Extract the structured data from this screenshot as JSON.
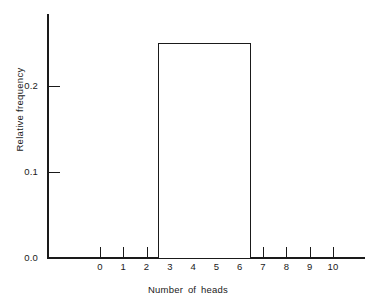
{
  "chart_data": {
    "type": "bar",
    "title": "",
    "subtitle": "",
    "xlabel": "Number of heads",
    "ylabel": "Relative frequency",
    "xlim": [
      -0.5,
      11.5
    ],
    "ylim": [
      0.0,
      0.28
    ],
    "grid": false,
    "legend": null,
    "x_tick_labels": [
      "0",
      "1",
      "2",
      "3",
      "4",
      "5",
      "6",
      "7",
      "8",
      "9",
      "10"
    ],
    "x_tick_values": [
      0,
      1,
      2,
      3,
      4,
      5,
      6,
      7,
      8,
      9,
      10
    ],
    "y_tick_labels": [
      "0.0",
      "0.1",
      "0.2"
    ],
    "y_tick_values": [
      0.0,
      0.1,
      0.2
    ],
    "categories": [
      "0",
      "1",
      "2",
      "3",
      "4",
      "5",
      "6",
      "7",
      "8",
      "9",
      "10"
    ],
    "values": [
      0,
      0,
      0,
      0.25,
      0.25,
      0.25,
      0.25,
      0,
      0,
      0,
      0
    ],
    "bars": [
      {
        "label": "3-6",
        "x_start": 2.5,
        "x_end": 6.5,
        "height": 0.25
      }
    ],
    "annotations": [],
    "colors": {
      "axis": "#1a1a1a",
      "bar_outline": "#1a1a1a",
      "bar_fill": "#ffffff",
      "background": "#ffffff",
      "text": "#1a1a1a"
    }
  }
}
